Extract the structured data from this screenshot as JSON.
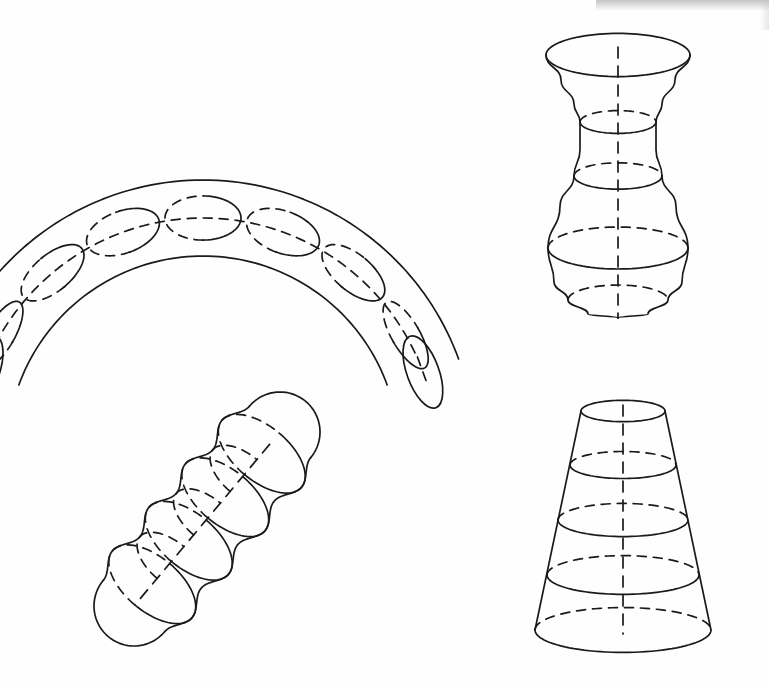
{
  "page": {
    "width": 769,
    "height": 683,
    "background_color": "#fefefe",
    "ink_color": "#1a1a1a"
  },
  "style": {
    "stroke": "#1a1a1a",
    "stroke_width": 1.7,
    "dash_pattern": "9 7",
    "axis_dash_pattern": "11 8",
    "fill": "none"
  },
  "figures": [
    {
      "id": "elbow-tube",
      "name": "curved-elbow-tube",
      "label": "Curved elbow tube",
      "position": "top-left",
      "type": "swept-circular-tube",
      "bend_center": [
        203,
        452
      ],
      "bend_radius_outer": 272,
      "bend_radius_inner": 196,
      "bend_radius_axis": 234,
      "start_angle_deg": 200,
      "end_angle_deg": 340,
      "tube_radius": 38,
      "cross_sections": 7,
      "end_caps": 2,
      "has_dashed_axis_arc": true
    },
    {
      "id": "vase",
      "name": "vase-solid-of-revolution",
      "label": "Vase (surface of revolution)",
      "position": "top-right",
      "type": "surface-of-revolution",
      "axis_x": 618,
      "axis_top_y": 47,
      "axis_bottom_y": 318,
      "profile": [
        {
          "y": 55,
          "radius": 72,
          "ring": "rim",
          "ring_style": "full-solid"
        },
        {
          "y": 80,
          "radius": 57,
          "ring": null,
          "ring_style": null
        },
        {
          "y": 104,
          "radius": 44,
          "ring": null,
          "ring_style": null
        },
        {
          "y": 122,
          "radius": 38,
          "ring": "neck",
          "ring_style": "front-solid-back-dashed"
        },
        {
          "y": 150,
          "radius": 38,
          "ring": null,
          "ring_style": null
        },
        {
          "y": 176,
          "radius": 44,
          "ring": "shoulder",
          "ring_style": "front-solid-back-dashed"
        },
        {
          "y": 206,
          "radius": 58,
          "ring": null,
          "ring_style": null
        },
        {
          "y": 248,
          "radius": 70,
          "ring": "belly",
          "ring_style": "front-solid-back-dashed"
        },
        {
          "y": 282,
          "radius": 64,
          "ring": null,
          "ring_style": null
        },
        {
          "y": 300,
          "radius": 50,
          "ring": "base",
          "ring_style": "back-dashed-only"
        },
        {
          "y": 314,
          "radius": 30,
          "ring": null,
          "ring_style": null
        },
        {
          "y": 318,
          "radius": 0,
          "ring": null,
          "ring_style": null
        }
      ],
      "ellipse_ratio": 0.3,
      "has_dashed_axis": true
    },
    {
      "id": "wavy-cylinder",
      "name": "wavy-beaded-cylinder",
      "label": "Wavy beaded cylinder",
      "position": "bottom-left",
      "type": "undulating-tube",
      "axis_start": [
        134,
        606
      ],
      "axis_end": [
        280,
        432
      ],
      "tilt_deg": -50,
      "bead_count": 4,
      "bead_radius_max": 52,
      "bead_radius_min": 40,
      "cross_sections": 4,
      "has_dashed_axis": true
    },
    {
      "id": "cone-frustum",
      "name": "truncated-cone-frustum",
      "label": "Truncated cone (frustum)",
      "position": "bottom-right",
      "type": "frustum",
      "axis_x": 623,
      "top_y": 411,
      "bottom_y": 630,
      "top_radius": 42,
      "bottom_radius": 88,
      "ellipse_ratio": 0.255,
      "cross_sections": [
        {
          "y": 411,
          "radius": 42,
          "style": "full-solid-rim"
        },
        {
          "y": 465,
          "radius": 53,
          "style": "front-solid-back-dashed"
        },
        {
          "y": 520,
          "radius": 65,
          "style": "front-solid-back-dashed"
        },
        {
          "y": 575,
          "radius": 76,
          "style": "front-solid-back-dashed"
        },
        {
          "y": 630,
          "radius": 88,
          "style": "front-solid-back-dashed"
        }
      ],
      "has_dashed_axis": true
    }
  ],
  "scan_artifacts": {
    "top_edge_shadow": true,
    "right_edge_shadow": true
  }
}
